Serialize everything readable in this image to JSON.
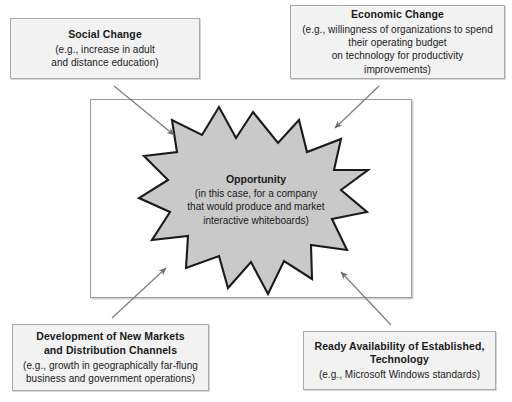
{
  "diagram": {
    "type": "influences-to-opportunity",
    "center": {
      "shape": "12-point-burst",
      "fill_color": "#c9c9c9",
      "stroke_color": "#1a1a1a",
      "title": "Opportunity",
      "detail": "(in this case, for a company\nthat would produce and market\ninteractive whiteboards)"
    },
    "frame": {
      "border_color": "#9a9a9a",
      "background": "#ffffff"
    },
    "boxes": [
      {
        "id": "social-change",
        "title": "Social Change",
        "detail": "(e.g., increase in adult\nand distance education)",
        "position": "top-left"
      },
      {
        "id": "economic-change",
        "title": "Economic Change",
        "detail": "(e.g., willingness of organizations to spend\ntheir operating budget\non technology for productivity improvements)",
        "position": "top-right"
      },
      {
        "id": "new-markets",
        "title": "Development of New Markets\nand Distribution Channels",
        "detail": "(e.g., growth in geographically far-flung\nbusiness and government operations)",
        "position": "bottom-left"
      },
      {
        "id": "ready-technology",
        "title": "Ready Availability of Established,\nTechnology",
        "detail": "(e.g., Microsoft Windows standards)",
        "position": "bottom-right"
      }
    ],
    "arrows": [
      {
        "id": "arrow-social-to-center",
        "from": "social-change",
        "to": "opportunity",
        "color": "#7d7d7d"
      },
      {
        "id": "arrow-economic-to-center",
        "from": "economic-change",
        "to": "opportunity",
        "color": "#7d7d7d"
      },
      {
        "id": "arrow-markets-to-center",
        "from": "new-markets",
        "to": "opportunity",
        "color": "#7d7d7d"
      },
      {
        "id": "arrow-technology-to-center",
        "from": "ready-technology",
        "to": "opportunity",
        "color": "#7d7d7d"
      }
    ],
    "colors": {
      "box_fill": "#f2f2f2",
      "box_border": "#a9a9a9",
      "burst_fill": "#c9c9c9",
      "text": "#1a1a1a",
      "arrow": "#7d7d7d"
    }
  }
}
